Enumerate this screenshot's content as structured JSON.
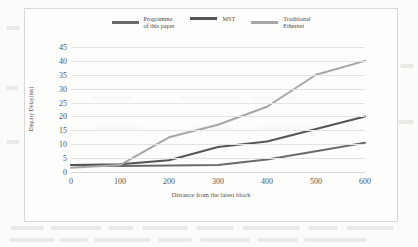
{
  "chart_data": {
    "type": "line",
    "title": "",
    "xlabel": "Distance from the latest block",
    "ylabel": "Enquiry Delay(ms)",
    "x": [
      0,
      100,
      200,
      300,
      400,
      500,
      600
    ],
    "xticks": [
      "0",
      "100",
      "200",
      "300",
      "400",
      "500",
      "600"
    ],
    "yticks": [
      "0",
      "5",
      "10",
      "15",
      "20",
      "25",
      "30",
      "35",
      "40",
      "45"
    ],
    "xlim": [
      0,
      600
    ],
    "ylim": [
      0,
      45
    ],
    "grid": true,
    "legend_position": "top-center",
    "series": [
      {
        "name": "Programme\nof this paper",
        "color": "#6b6b6b",
        "values": [
          2.5,
          2.2,
          2.3,
          2.5,
          4.5,
          7.5,
          10.5
        ]
      },
      {
        "name": "MST",
        "color": "#555555",
        "values": [
          2.5,
          2.8,
          4.2,
          9.0,
          11.0,
          15.5,
          20.0
        ]
      },
      {
        "name": "Traditional\nEthernet",
        "color": "#a6a6a6",
        "values": [
          1.5,
          2.5,
          12.5,
          17.0,
          23.5,
          35.0,
          40.0
        ]
      }
    ]
  },
  "figure": {
    "border_color": "#d8d8d4",
    "gridline_color": "#e3e3df",
    "background": "#fbfbf9"
  }
}
